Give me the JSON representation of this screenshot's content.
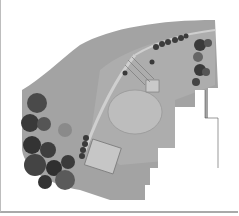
{
  "figure": {
    "type": "landscape site plan rendering",
    "colors": {
      "lawn": "#9c9c9c",
      "lawn_light": "#b3b3b3",
      "paving": "#c4c4c4",
      "trees_dark": "#3a3a3a",
      "trees_mid": "#6e6e6e",
      "background": "#ffffff"
    },
    "elements": [
      "curved-garden-lawn",
      "oval-lawn",
      "patio-square",
      "pergola",
      "tree-cluster-west",
      "tree-row-north",
      "tree-cluster-east",
      "building-footprint"
    ],
    "caption": "",
    "signature_text": ""
  }
}
